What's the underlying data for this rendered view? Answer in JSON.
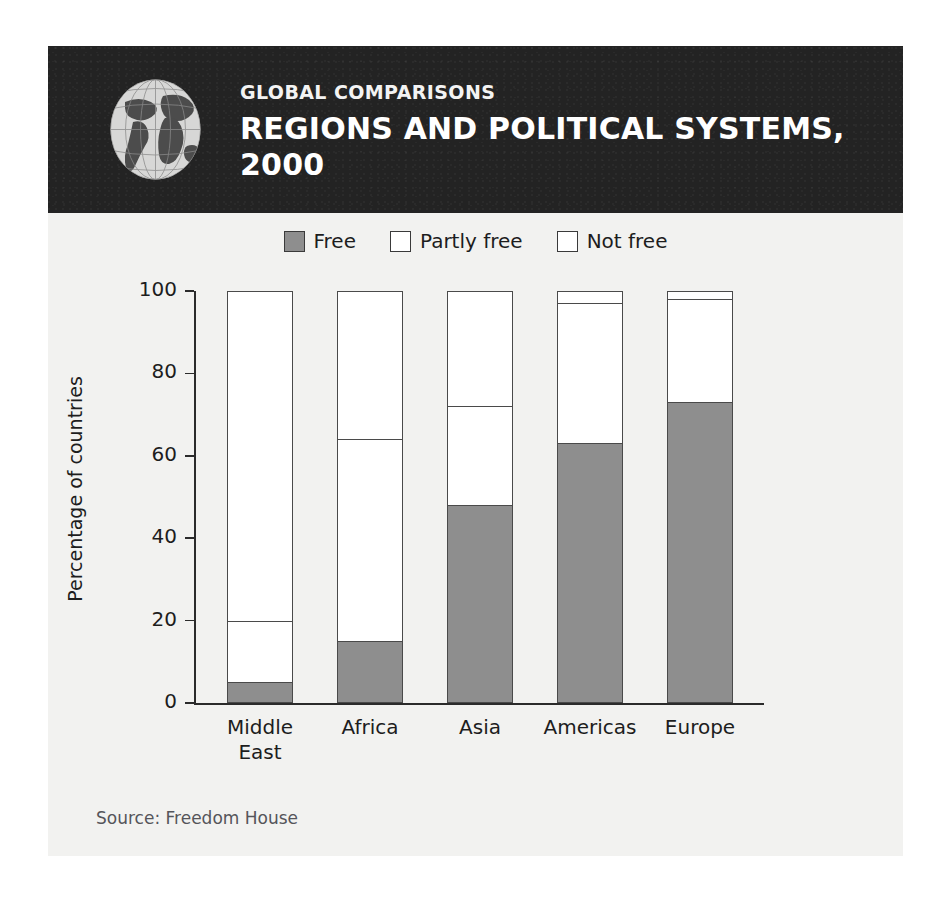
{
  "header": {
    "kicker": "GLOBAL COMPARISONS",
    "title_line1": "REGIONS AND POLITICAL SYSTEMS,",
    "title_line2": "2000",
    "globe_icon": "globe-icon",
    "band_color": "#232323"
  },
  "legend": {
    "items": [
      {
        "label": "Free",
        "color": "#8e8e8e",
        "border": "#3a3a3a"
      },
      {
        "label": "Partly free",
        "color": "#ffffff",
        "border": "#3a3a3a"
      },
      {
        "label": "Not free",
        "color": "#ffffff",
        "border": "#3a3a3a"
      }
    ]
  },
  "source": "Source: Freedom House",
  "chart_data": {
    "type": "bar",
    "stacked": true,
    "title": "Regions and Political Systems, 2000",
    "xlabel": "",
    "ylabel": "Percentage of countries",
    "ylim": [
      0,
      100
    ],
    "yticks": [
      0,
      20,
      40,
      60,
      80,
      100
    ],
    "ytick_labels": [
      "0",
      "20",
      "40",
      "60",
      "80",
      "100"
    ],
    "grid": false,
    "legend_position": "top-center",
    "categories": [
      "Middle East",
      "Africa",
      "Asia",
      "Americas",
      "Europe"
    ],
    "category_lines": [
      [
        "Middle",
        "East"
      ],
      [
        "Africa"
      ],
      [
        "Asia"
      ],
      [
        "Americas"
      ],
      [
        "Europe"
      ]
    ],
    "series": [
      {
        "name": "Free",
        "color": "#8e8e8e",
        "values": [
          5,
          15,
          48,
          63,
          73
        ]
      },
      {
        "name": "Partly free",
        "color": "#ffffff",
        "values": [
          15,
          49,
          24,
          34,
          25
        ]
      },
      {
        "name": "Not free",
        "color": "#ffffff",
        "values": [
          80,
          36,
          28,
          3,
          2
        ]
      }
    ],
    "cumulative_tops": {
      "free": [
        5,
        15,
        48,
        63,
        73
      ],
      "partly_free": [
        20,
        64,
        72,
        97,
        98
      ],
      "not_free": [
        100,
        100,
        100,
        100,
        100
      ]
    }
  }
}
